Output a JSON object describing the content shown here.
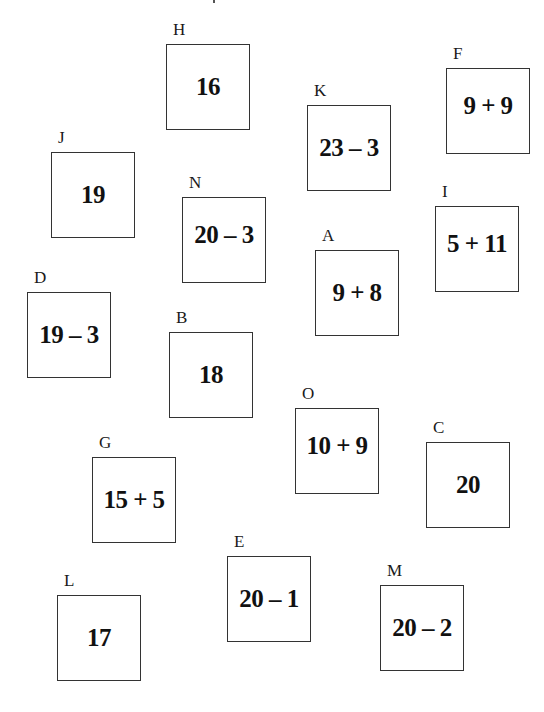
{
  "cards": [
    {
      "label": "H",
      "value": "16"
    },
    {
      "label": "F",
      "value": "9 + 9"
    },
    {
      "label": "K",
      "value": "23 – 3"
    },
    {
      "label": "J",
      "value": "19"
    },
    {
      "label": "N",
      "value": "20 – 3"
    },
    {
      "label": "I",
      "value": "5 + 11"
    },
    {
      "label": "A",
      "value": "9 + 8"
    },
    {
      "label": "D",
      "value": "19 – 3"
    },
    {
      "label": "B",
      "value": "18"
    },
    {
      "label": "O",
      "value": "10 + 9"
    },
    {
      "label": "C",
      "value": "20"
    },
    {
      "label": "G",
      "value": "15 + 5"
    },
    {
      "label": "E",
      "value": "20 – 1"
    },
    {
      "label": "L",
      "value": "17"
    },
    {
      "label": "M",
      "value": "20 – 2"
    }
  ]
}
